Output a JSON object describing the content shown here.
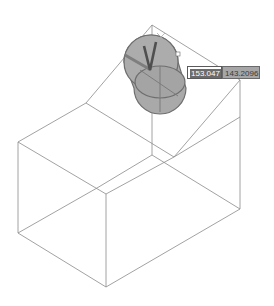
{
  "viewport": {
    "background": "#ffffff",
    "wire_color": "#8a8a8a",
    "gizmo_fill": "#a9a9a9",
    "gizmo_stroke": "#6e6e6e"
  },
  "dynamic_input": {
    "field_a": {
      "value": "153.047",
      "selected": true
    },
    "field_b": {
      "value": "143.2096"
    }
  },
  "icons": {
    "gizmo": "3d-rotate-gizmo",
    "crosshair": "cursor-crosshair-icon"
  }
}
